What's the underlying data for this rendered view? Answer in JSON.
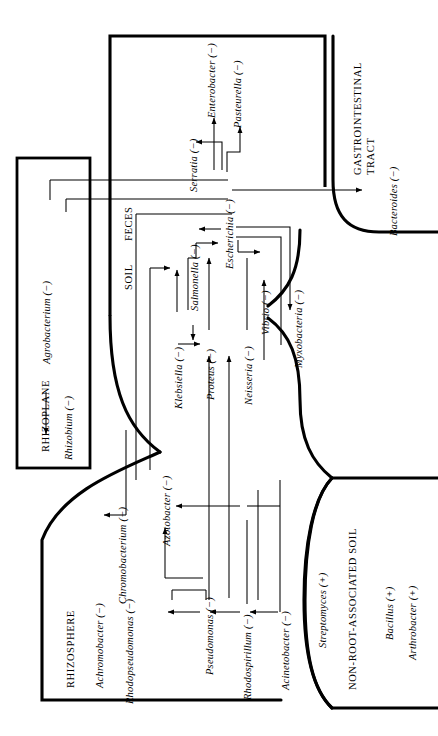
{
  "figure": {
    "type": "ecological-habitat-diagram",
    "orientation": "rotated-90-ccw"
  },
  "regions": {
    "rhizosphere": "RHIZOSPHERE",
    "rhizoplane": "RHIZOPLANE",
    "soil": "SOIL",
    "feces": "FECES",
    "non_root_soil": "NON-ROOT-ASSOCIATED SOIL",
    "gastrointestinal_line1": "GASTROINTESTINAL",
    "gastrointestinal_line2": "TRACT"
  },
  "organisms": {
    "enterobacter": "Enterobacter (−)",
    "pasteurella": "Pasteurella (−)",
    "serratia": "Serratia (−)",
    "bacteroides": "Bacteroides (−)",
    "escherichia": "Escherichia (−)",
    "salmonella": "Salmonella (−)",
    "klebsiella": "Klebsiella (−)",
    "proteus": "Proteus (−)",
    "neisseria": "Neisseria (−)",
    "vibrio": "Vibrio (−)",
    "myxobacteria": "Myxobacteria (−)",
    "agrobacterium": "Agrobacterium (−)",
    "rhizobium": "Rhizobium (−)",
    "chromobacterium": "Chromobacterium (−)",
    "achromobacter": "Achromobacter (−)",
    "rhodopseudomonas": "Rhodopseudomonas (−)",
    "azotobacter": "Azotobacter (−)",
    "pseudomonas": "Pseudomonas (−)",
    "rhodospirillum": "Rhodospirillum (−)",
    "acinetobacter": "Acinetobacter (−)",
    "streptomyces": "Streptomyces (+)",
    "bacillus": "Bacillus (+)",
    "arthrobacter": "Arthrobacter (+)"
  },
  "gram_key": {
    "negative": "(−)",
    "positive": "(+)"
  },
  "colors": {
    "ink": "#000000",
    "background": "#ffffff"
  }
}
